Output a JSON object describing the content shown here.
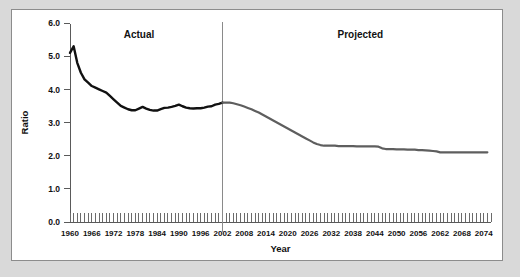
{
  "chart_data": {
    "type": "line",
    "title": "",
    "xlabel": "Year",
    "ylabel": "Ratio",
    "xlim": [
      1960,
      2076
    ],
    "ylim": [
      0.0,
      6.0
    ],
    "grid": false,
    "legend_position": "none",
    "y_ticks": [
      "0.0",
      "1.0",
      "2.0",
      "3.0",
      "4.0",
      "5.0",
      "6.0"
    ],
    "y_tick_values": [
      0.0,
      1.0,
      2.0,
      3.0,
      4.0,
      5.0,
      6.0
    ],
    "x_ticks": [
      "1960",
      "1966",
      "1972",
      "1978",
      "1984",
      "1990",
      "1996",
      "2002",
      "2008",
      "2014",
      "2020",
      "2026",
      "2032",
      "2038",
      "2044",
      "2050",
      "2056",
      "2062",
      "2068",
      "2074"
    ],
    "x_tick_values": [
      1960,
      1966,
      1972,
      1978,
      1984,
      1990,
      1996,
      2002,
      2008,
      2014,
      2020,
      2026,
      2032,
      2038,
      2044,
      2050,
      2056,
      2062,
      2068,
      2074
    ],
    "x_minor_tick_step": 1,
    "annotations": [
      {
        "text": "Actual",
        "x": 1979,
        "y": 5.55
      },
      {
        "text": "Projected",
        "x": 2040,
        "y": 5.55
      }
    ],
    "divider": {
      "x": 2002,
      "label": "actual-projected-boundary"
    },
    "colors": {
      "actual": "#111111",
      "projected": "#5e5e5e",
      "divider": "#8a8a8a",
      "axis": "#5a5a5a",
      "panel_background": "#ffffff",
      "page_background": "#d9d9d9",
      "panel_border": "#8c8c8c"
    },
    "series": [
      {
        "name": "Actual",
        "color": "#111111",
        "x": [
          1960,
          1961,
          1962,
          1963,
          1964,
          1965,
          1966,
          1967,
          1968,
          1969,
          1970,
          1971,
          1972,
          1973,
          1974,
          1975,
          1976,
          1977,
          1978,
          1979,
          1980,
          1981,
          1982,
          1983,
          1984,
          1985,
          1986,
          1987,
          1988,
          1989,
          1990,
          1991,
          1992,
          1993,
          1994,
          1995,
          1996,
          1997,
          1998,
          1999,
          2000,
          2001,
          2002
        ],
        "values": [
          5.1,
          5.3,
          4.8,
          4.5,
          4.3,
          4.2,
          4.1,
          4.05,
          4.0,
          3.95,
          3.9,
          3.8,
          3.7,
          3.6,
          3.5,
          3.45,
          3.4,
          3.37,
          3.37,
          3.42,
          3.47,
          3.42,
          3.38,
          3.36,
          3.36,
          3.4,
          3.44,
          3.45,
          3.47,
          3.5,
          3.54,
          3.49,
          3.45,
          3.43,
          3.42,
          3.43,
          3.43,
          3.45,
          3.48,
          3.49,
          3.54,
          3.56,
          3.6
        ]
      },
      {
        "name": "Projected",
        "color": "#5e5e5e",
        "x": [
          2002,
          2003,
          2004,
          2005,
          2006,
          2007,
          2008,
          2009,
          2010,
          2011,
          2012,
          2013,
          2014,
          2015,
          2016,
          2017,
          2018,
          2019,
          2020,
          2021,
          2022,
          2023,
          2024,
          2025,
          2026,
          2027,
          2028,
          2029,
          2030,
          2031,
          2032,
          2033,
          2034,
          2035,
          2036,
          2037,
          2038,
          2039,
          2040,
          2041,
          2042,
          2043,
          2044,
          2045,
          2046,
          2047,
          2048,
          2049,
          2050,
          2051,
          2052,
          2053,
          2054,
          2055,
          2056,
          2057,
          2058,
          2059,
          2060,
          2061,
          2062,
          2063,
          2064,
          2065,
          2066,
          2067,
          2068,
          2069,
          2070,
          2071,
          2072,
          2073,
          2074,
          2075
        ],
        "values": [
          3.6,
          3.6,
          3.6,
          3.58,
          3.55,
          3.52,
          3.48,
          3.44,
          3.4,
          3.35,
          3.3,
          3.24,
          3.18,
          3.12,
          3.06,
          3.0,
          2.94,
          2.88,
          2.82,
          2.76,
          2.7,
          2.64,
          2.58,
          2.52,
          2.46,
          2.4,
          2.35,
          2.32,
          2.3,
          2.3,
          2.3,
          2.3,
          2.29,
          2.29,
          2.29,
          2.29,
          2.29,
          2.28,
          2.28,
          2.28,
          2.28,
          2.28,
          2.28,
          2.27,
          2.22,
          2.2,
          2.2,
          2.2,
          2.19,
          2.19,
          2.19,
          2.18,
          2.18,
          2.18,
          2.17,
          2.17,
          2.16,
          2.15,
          2.14,
          2.13,
          2.1,
          2.1,
          2.1,
          2.1,
          2.1,
          2.1,
          2.1,
          2.1,
          2.1,
          2.1,
          2.1,
          2.1,
          2.1,
          2.1
        ]
      }
    ]
  }
}
